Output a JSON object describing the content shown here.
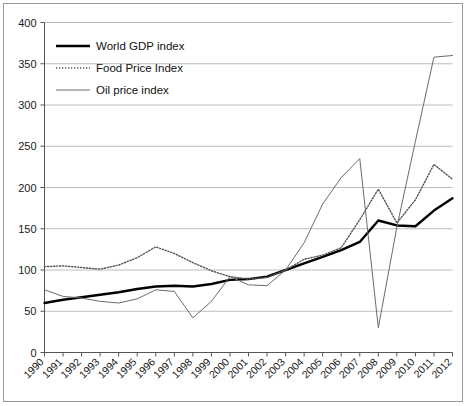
{
  "chart_data": {
    "type": "line",
    "title": "",
    "xlabel": "",
    "ylabel": "",
    "ylim": [
      0,
      400
    ],
    "ytick_step": 50,
    "yticks": [
      "0",
      "50",
      "100",
      "150",
      "200",
      "250",
      "300",
      "350",
      "400"
    ],
    "grid": true,
    "legend_position": "upper-left-inside",
    "x": [
      "1990",
      "1991",
      "1992",
      "1993",
      "1994",
      "1995",
      "1996",
      "1997",
      "1998",
      "1999",
      "2000",
      "2001",
      "2002",
      "2003",
      "2004",
      "2005",
      "2006",
      "2007",
      "2008",
      "2009",
      "2010",
      "2011",
      "2012"
    ],
    "series": [
      {
        "name": "World GDP index",
        "style": "solid-thick",
        "color": "#000000",
        "values": [
          60,
          64,
          67,
          70,
          73,
          77,
          80,
          81,
          80,
          83,
          88,
          89,
          92,
          100,
          108,
          116,
          124,
          134,
          160,
          154,
          153,
          172,
          187
        ]
      },
      {
        "name": "Food Price Index",
        "style": "dotted",
        "color": "#555555",
        "values": [
          104,
          105,
          103,
          101,
          106,
          115,
          128,
          120,
          109,
          99,
          92,
          89,
          91,
          100,
          113,
          118,
          127,
          161,
          198,
          157,
          185,
          228,
          210
        ]
      },
      {
        "name": "Oil price index",
        "style": "solid-thin",
        "color": "#6b6b6b",
        "values": [
          76,
          68,
          66,
          62,
          60,
          65,
          76,
          74,
          42,
          62,
          92,
          82,
          81,
          100,
          133,
          180,
          212,
          235,
          30,
          152,
          256,
          358,
          360
        ]
      }
    ]
  },
  "legend": {
    "items": [
      {
        "label": "World GDP index",
        "swatch": "solid-thick"
      },
      {
        "label": "Food Price Index",
        "swatch": "dotted"
      },
      {
        "label": "Oil price index",
        "swatch": "solid-thin"
      }
    ]
  }
}
